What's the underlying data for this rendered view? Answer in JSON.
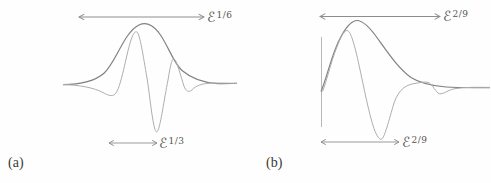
{
  "figure": {
    "panel_a": {
      "caption": "(a)",
      "top_width_label": {
        "base": "ℰ",
        "exp": "1/6"
      },
      "bottom_width_label": {
        "base": "ℰ",
        "exp": "1/3"
      },
      "curves": [
        "envelope",
        "oscillatory-pulse"
      ]
    },
    "panel_b": {
      "caption": "(b)",
      "top_width_label": {
        "base": "ℰ",
        "exp": "2/9"
      },
      "bottom_width_label": {
        "base": "ℰ",
        "exp": "2/9"
      },
      "curves": [
        "envelope",
        "oscillatory-pulse"
      ]
    },
    "colors": {
      "envelope_stroke": "#808086",
      "pulse_stroke": "#aeaeae",
      "arrow_stroke": "#8d8d8d",
      "label_text": "#56564f",
      "caption_text": "#3a3a3a",
      "background": "#fefefe"
    }
  }
}
